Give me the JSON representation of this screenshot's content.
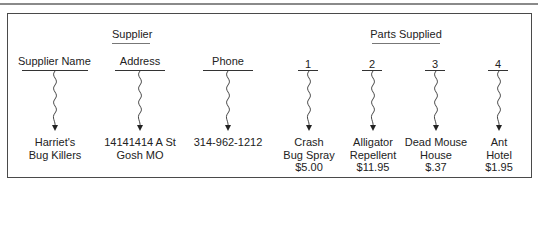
{
  "groups": {
    "supplier": "Supplier",
    "parts_supplied": "Parts Supplied"
  },
  "columns": [
    {
      "header": "Supplier Name",
      "value_lines": [
        "Harriet's",
        "Bug Killers"
      ]
    },
    {
      "header": "Address",
      "value_lines": [
        "14141414 A St",
        "Gosh MO"
      ]
    },
    {
      "header": "Phone",
      "value_lines": [
        "314-962-1212"
      ]
    },
    {
      "header": "1",
      "value_lines": [
        "Crash",
        "Bug Spray",
        "$5.00"
      ]
    },
    {
      "header": "2",
      "value_lines": [
        "Alligator",
        "Repellent",
        "$11.95"
      ]
    },
    {
      "header": "3",
      "value_lines": [
        "Dead Mouse",
        "House",
        "$.37"
      ]
    },
    {
      "header": "4",
      "value_lines": [
        "Ant",
        "Hotel",
        "$1.95"
      ]
    }
  ],
  "colors": {
    "line": "#333333",
    "text": "#222222",
    "border": "#4a4a4a"
  }
}
